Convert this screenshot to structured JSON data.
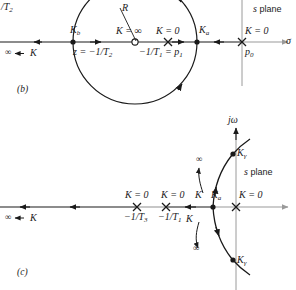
{
  "figure": {
    "title_hidden": "",
    "panels": [
      {
        "tag": "(b)",
        "plane_label": "s plane",
        "axis_real_symbol": "σ",
        "axis_imag_symbol": "",
        "clipped_top_left_label": "/T",
        "clipped_top_left_sub": "2",
        "radius_label": "R",
        "annotations": {
          "k_b": "K",
          "k_b_sub": "b",
          "k_a": "K",
          "k_a_sub": "a",
          "k_inf": "K = ∞",
          "k_zero_1": "K = 0",
          "k_zero_2": "K = 0",
          "zero_text": "z = −1/T",
          "zero_sub": "2",
          "pole_text": "−1/T",
          "pole_sub": "1",
          "pole_eq": "= p",
          "pole_eq_sub": "1",
          "p0_label": "p",
          "p0_sub": "0",
          "k_to_infinity": "∞ ← K"
        }
      },
      {
        "tag": "(c)",
        "plane_label": "s plane",
        "axis_real_symbol": "",
        "axis_imag_symbol": "jω",
        "annotations": {
          "k_zero_T3": "K = 0",
          "k_zero_T1": "K = 0",
          "k_zero_origin": "K = 0",
          "pole_T3": "−1/T",
          "pole_T3_sub": "3",
          "pole_T1": "−1/T",
          "pole_T1_sub": "1",
          "k_to_infinity": "∞ ← K",
          "k_upper_branch": "K",
          "k_upper_inf": "∞",
          "k_lower_branch": "K",
          "k_lower_inf": "∞",
          "k_a_upper": "K",
          "k_a_upper_sub": "a",
          "k_gamma_upper": "K",
          "k_gamma_upper_sub": "γ",
          "k_gamma_lower": "K",
          "k_gamma_lower_sub": "γ"
        }
      }
    ],
    "colors": {
      "ink": "#1a1a1a",
      "axis_gray": "#9a9a9a",
      "locus": "#1a1a1a"
    }
  }
}
